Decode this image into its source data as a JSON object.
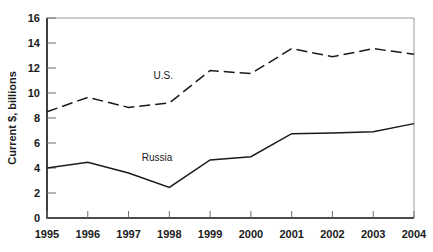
{
  "chart_data": {
    "type": "line",
    "title": "",
    "subtitle": "",
    "xlabel": "",
    "ylabel": "Current $, billions",
    "x": [
      "1995",
      "1996",
      "1997",
      "1998",
      "1999",
      "2000",
      "2001",
      "2002",
      "2003",
      "2004"
    ],
    "categories": [
      "1995",
      "1996",
      "1997",
      "1998",
      "1999",
      "2000",
      "2001",
      "2002",
      "2003",
      "2004"
    ],
    "xlim": [
      1995,
      2004
    ],
    "ylim": [
      0,
      16
    ],
    "yticks": [
      0,
      2,
      4,
      6,
      8,
      10,
      12,
      14,
      16
    ],
    "ytick_labels": [
      "0",
      "2",
      "4",
      "6",
      "8",
      "10",
      "12",
      "14",
      "16"
    ],
    "grid": false,
    "legend": "inline-annotations",
    "series": [
      {
        "name": "U.S.",
        "style": "dashed",
        "color": "#1a1a1a",
        "values": [
          8.5,
          9.65,
          8.85,
          9.2,
          11.8,
          11.55,
          13.55,
          12.9,
          13.55,
          13.1
        ]
      },
      {
        "name": "Russia",
        "style": "solid",
        "color": "#1a1a1a",
        "values": [
          4.0,
          4.45,
          3.6,
          2.45,
          4.65,
          4.9,
          6.75,
          6.8,
          6.9,
          7.55
        ]
      }
    ],
    "annotations": [
      {
        "text": "U.S.",
        "series": "U.S.",
        "x": 1997.85,
        "y": 11.15
      },
      {
        "text": "Russia",
        "series": "Russia",
        "x": 1997.7,
        "y": 4.55
      }
    ]
  }
}
